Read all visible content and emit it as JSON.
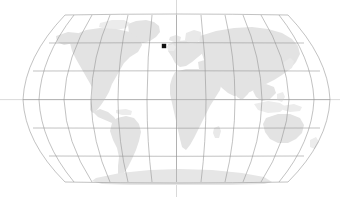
{
  "map": {
    "title": "World map",
    "projection": "Robinson",
    "background_color": "#ffffff",
    "land_color": "#e3e3e3",
    "land_color_light": "#ececec",
    "graticule_color": "#8f8f8f",
    "axis_color": "#b9b9b9",
    "marker_color": "#111111",
    "frame": {
      "left": 23,
      "right": 330,
      "top": 14,
      "bottom": 183,
      "center_x": 176.5,
      "center_y": 99.5
    },
    "graticule": {
      "meridian_step_degrees": 30,
      "parallel_step_degrees": 30,
      "meridian_labels": [
        "-180",
        "-150",
        "-120",
        "-90",
        "-60",
        "-30",
        "0",
        "30",
        "60",
        "90",
        "120",
        "150",
        "180"
      ],
      "parallel_labels": [
        "75",
        "60",
        "30",
        "0",
        "-30",
        "-60",
        "-75"
      ],
      "parallel_pixel_rows": [
        43,
        71,
        100,
        128,
        156
      ],
      "show_grid": true,
      "show_central_meridian_axis": true,
      "show_equator_axis": true
    },
    "markers": [
      {
        "name": "location-marker",
        "x": 164,
        "y": 46,
        "size": 4.4,
        "shape": "square",
        "color": "#111111",
        "label": ""
      }
    ],
    "landmasses": [
      "north-america",
      "greenland",
      "south-america",
      "europe",
      "africa",
      "asia",
      "australia",
      "antarctica"
    ]
  }
}
